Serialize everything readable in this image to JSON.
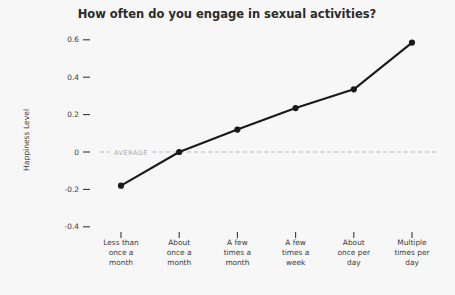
{
  "chart_data": {
    "type": "line",
    "title": "How often do you engage in sexual activities?",
    "xlabel": "",
    "ylabel": "Happiness Level",
    "categories": [
      "Less than once a month",
      "About once a month",
      "A few times a month",
      "A few times a week",
      "About once per day",
      "Multiple times per day"
    ],
    "category_lines": [
      [
        "Less than",
        "once a",
        "month"
      ],
      [
        "About",
        "once a",
        "month"
      ],
      [
        "A few",
        "times a",
        "month"
      ],
      [
        "A few",
        "times a",
        "week"
      ],
      [
        "About",
        "once per",
        "day"
      ],
      [
        "Multiple",
        "times per",
        "day"
      ]
    ],
    "values": [
      -0.18,
      0.0,
      0.12,
      0.235,
      0.335,
      0.585
    ],
    "ylim": [
      -0.45,
      0.65
    ],
    "yticks": [
      0.6,
      0.4,
      0.2,
      0,
      -0.2,
      -0.4
    ],
    "ytick_labels": [
      "0.6",
      "0.4",
      "0.2",
      "0",
      "-0.2",
      "-0.4"
    ],
    "grid": false,
    "legend": "none",
    "annotations": [
      {
        "name": "average-reference-line",
        "label": "AVERAGE",
        "y": 0
      }
    ],
    "colors": {
      "line": "#1a1a1a",
      "marker": "#1a1a1a",
      "average": "#b9b9b9",
      "text": "#3a3a3a",
      "title": "#2b2b2b",
      "background": "#f7f7f7"
    }
  }
}
